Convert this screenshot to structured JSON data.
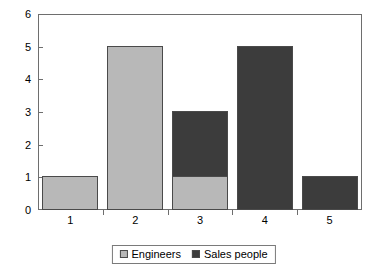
{
  "chart_data": {
    "type": "bar",
    "stacked": true,
    "title": "",
    "subtitle": "",
    "xlabel": "",
    "ylabel": "",
    "categories": [
      "1",
      "2",
      "3",
      "4",
      "5"
    ],
    "series": [
      {
        "name": "Engineers",
        "color": "#b8b8b8",
        "values": [
          1,
          5,
          1,
          0,
          0
        ]
      },
      {
        "name": "Sales people",
        "color": "#3c3c3c",
        "values": [
          0,
          0,
          2,
          5,
          1
        ]
      }
    ],
    "totals": [
      1,
      5,
      3,
      5,
      1
    ],
    "ylim": [
      0,
      6
    ],
    "y_ticks": [
      "0",
      "1",
      "2",
      "3",
      "4",
      "5",
      "6"
    ],
    "x_ticks": [
      "1",
      "2",
      "3",
      "4",
      "5"
    ],
    "grid": false,
    "legend_position": "bottom-center",
    "frame_color": "#6e6e6e",
    "bar_border_color": "#4a4a4a",
    "background": "#ffffff"
  },
  "legend": {
    "entries": [
      {
        "label": "Engineers",
        "swatch": "#b8b8b8"
      },
      {
        "label": "Sales people",
        "swatch": "#3c3c3c"
      }
    ]
  }
}
